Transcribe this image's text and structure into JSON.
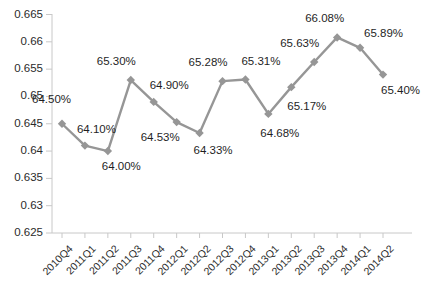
{
  "chart_data": {
    "type": "line",
    "title": "",
    "subtitle": "",
    "xlabel": "",
    "ylabel": "",
    "grid": false,
    "legend": "none",
    "ylim": [
      0.625,
      0.665
    ],
    "ytick_labels": [
      "0.665",
      "0.66",
      "0.655",
      "0.65",
      "0.645",
      "0.64",
      "0.635",
      "0.63",
      "0.625"
    ],
    "ytick_values": [
      0.665,
      0.66,
      0.655,
      0.65,
      0.645,
      0.64,
      0.635,
      0.63,
      0.625
    ],
    "categories": [
      "2010Q4",
      "2011Q1",
      "2011Q2",
      "2011Q3",
      "2011Q4",
      "2012Q1",
      "2012Q2",
      "2012Q3",
      "2012Q4",
      "2013Q1",
      "2013Q2",
      "2013Q3",
      "2013Q4",
      "2014Q1",
      "2014Q2"
    ],
    "values": [
      0.645,
      0.641,
      0.64,
      0.653,
      0.649,
      0.6453,
      0.6433,
      0.6528,
      0.6531,
      0.6468,
      0.6517,
      0.6563,
      0.6608,
      0.6589,
      0.654
    ],
    "point_labels": [
      "64.50%",
      "64.10%",
      "64.00%",
      "65.30%",
      "64.90%",
      "64.53%",
      "64.33%",
      "65.28%",
      "65.31%",
      "64.68%",
      "65.17%",
      "65.63%",
      "66.08%",
      "65.89%",
      "65.40%"
    ],
    "label_offsets": [
      {
        "dx": -30,
        "dy": -30
      },
      {
        "dx": -8,
        "dy": -22
      },
      {
        "dx": -6,
        "dy": 10
      },
      {
        "dx": -34,
        "dy": -24
      },
      {
        "dx": -4,
        "dy": -22
      },
      {
        "dx": -36,
        "dy": 10
      },
      {
        "dx": -6,
        "dy": 12
      },
      {
        "dx": -34,
        "dy": -24
      },
      {
        "dx": -4,
        "dy": -24
      },
      {
        "dx": -8,
        "dy": 14
      },
      {
        "dx": -4,
        "dy": 14
      },
      {
        "dx": -34,
        "dy": -24
      },
      {
        "dx": -32,
        "dy": -24
      },
      {
        "dx": 4,
        "dy": -20
      },
      {
        "dx": -2,
        "dy": 10
      }
    ],
    "series_color": "#969696",
    "marker": "diamond",
    "axis_color": "#c8c8c8"
  }
}
